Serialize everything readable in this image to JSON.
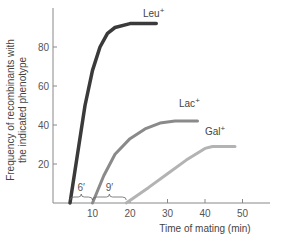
{
  "chart_data": {
    "type": "line",
    "title": "",
    "xlabel": "Time of mating (min)",
    "ylabel": [
      "Frequency of recombinants with",
      "the indicated phenotype"
    ],
    "xlim": [
      0,
      55
    ],
    "ylim": [
      0,
      100
    ],
    "x_ticks": [
      "10",
      "20",
      "30",
      "40",
      "50"
    ],
    "y_ticks": [
      "20",
      "40",
      "60",
      "80"
    ],
    "grid": false,
    "series": [
      {
        "name": "Leu+",
        "label": "Leu",
        "sup": "+",
        "color": "#3a3a3a",
        "x": [
          4,
          6,
          8,
          10,
          12,
          14,
          16,
          20,
          27
        ],
        "y": [
          0,
          25,
          50,
          68,
          80,
          87,
          90,
          92,
          92
        ]
      },
      {
        "name": "Lac+",
        "label": "Lac",
        "sup": "+",
        "color": "#8a8a8a",
        "x": [
          10,
          13,
          16,
          20,
          24,
          28,
          32,
          38
        ],
        "y": [
          0,
          14,
          25,
          33,
          38,
          41,
          42,
          42
        ]
      },
      {
        "name": "Gal+",
        "label": "Gal",
        "sup": "+",
        "color": "#b3b3b3",
        "x": [
          19,
          25,
          30,
          35,
          40,
          42,
          48
        ],
        "y": [
          0,
          8,
          15,
          22,
          28,
          29,
          29
        ]
      }
    ],
    "annotations": [
      {
        "text": "6′",
        "from_x": 4,
        "to_x": 10
      },
      {
        "text": "9′",
        "from_x": 10,
        "to_x": 19
      }
    ]
  }
}
